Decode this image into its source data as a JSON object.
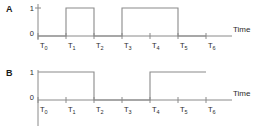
{
  "diagram": {
    "type": "timing-diagram",
    "title": "",
    "axis_label": "Time",
    "level_labels": [
      "1",
      "0"
    ],
    "tick_labels": [
      "T0",
      "T1",
      "T2",
      "T3",
      "T4",
      "T5",
      "T6"
    ],
    "tick_label_base": "T",
    "tick_label_subs": [
      "0",
      "1",
      "2",
      "3",
      "4",
      "5",
      "6"
    ],
    "line_color": "#8a8a8a",
    "text_color": "#2b2b2b",
    "background": "#ffffff",
    "signals": [
      {
        "name": "A",
        "initial_level": 0,
        "levels": [
          0,
          1,
          0,
          1,
          1,
          0,
          0
        ],
        "transitions": [
          {
            "at": "T1",
            "to": 1
          },
          {
            "at": "T2",
            "to": 0
          },
          {
            "at": "T3",
            "to": 1
          },
          {
            "at": "T5",
            "to": 0
          }
        ],
        "waveform_ends_at": "T6"
      },
      {
        "name": "B",
        "initial_level": 1,
        "levels": [
          1,
          1,
          0,
          0,
          1,
          1,
          1
        ],
        "transitions": [
          {
            "at": "T2",
            "to": 0
          },
          {
            "at": "T4",
            "to": 1
          }
        ],
        "waveform_ends_at": "T6"
      }
    ]
  }
}
